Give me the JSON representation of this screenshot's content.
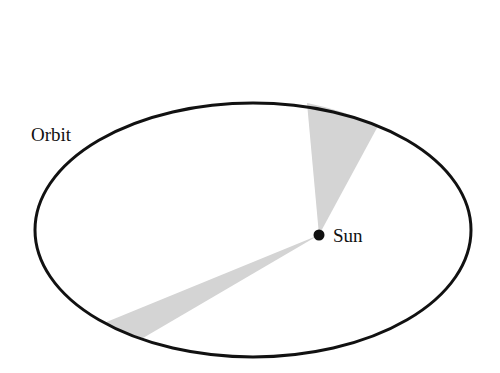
{
  "diagram": {
    "labels": {
      "orbit": "Orbit",
      "sun": "Sun"
    },
    "colors": {
      "orbit_stroke": "#111111",
      "wedge_fill": "#d4d4d4",
      "sun_fill": "#111111",
      "background": "#ffffff"
    },
    "orbit": {
      "cx": 253,
      "cy": 230,
      "rx": 218,
      "ry": 127
    },
    "sun": {
      "x": 319,
      "y": 235,
      "r": 5.5
    },
    "wedges": [
      {
        "name": "near-aphelion-wedge",
        "points": [
          [
            319,
            235
          ],
          [
            307,
            103
          ],
          [
            378,
            126
          ]
        ]
      },
      {
        "name": "far-side-wedge",
        "points": [
          [
            319,
            235
          ],
          [
            104,
            323
          ],
          [
            143,
            338
          ]
        ]
      }
    ]
  }
}
